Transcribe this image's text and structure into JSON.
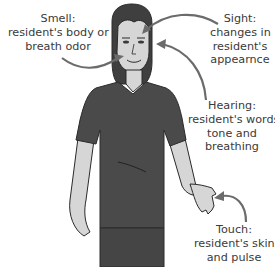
{
  "diagram": {
    "colors": {
      "arrow": "#6b6b6b",
      "shirt": "#4a4a4a",
      "skin": "#d6d6d6",
      "hair": "#3f3f3f",
      "outline": "#2a2a2a",
      "text": "#3a3a3a"
    },
    "labels": [
      {
        "id": "smell",
        "title": "Smell:",
        "lines": [
          "resident's body or",
          "breath odor"
        ]
      },
      {
        "id": "sight",
        "title": "Sight:",
        "lines": [
          "changes in",
          "resident's",
          "appearnce"
        ]
      },
      {
        "id": "hearing",
        "title": "Hearing:",
        "lines": [
          "resident's words,",
          "tone and",
          "breathing"
        ]
      },
      {
        "id": "touch",
        "title": "Touch:",
        "lines": [
          "resident's skin",
          "and pulse"
        ]
      }
    ]
  }
}
